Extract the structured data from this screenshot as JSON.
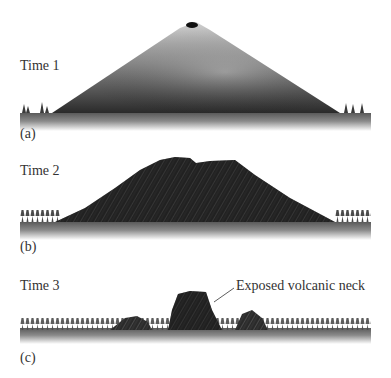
{
  "figure": {
    "panels": [
      {
        "id": "a",
        "time_label": "Time 1",
        "panel_label": "(a)",
        "description": "Intact volcanic cone with summit crater"
      },
      {
        "id": "b",
        "time_label": "Time 2",
        "panel_label": "(b)",
        "description": "Eroded volcano with rugged slopes"
      },
      {
        "id": "c",
        "time_label": "Time 3",
        "panel_label": "(c)",
        "description": "Mostly eroded; exposed volcanic neck remains"
      }
    ],
    "annotation": {
      "text": "Exposed volcanic neck"
    }
  },
  "colors": {
    "rock_dark": "#1e1e1e",
    "rock_light": "#bdbdbd",
    "ground": "#6a6a6a",
    "text": "#333333"
  }
}
